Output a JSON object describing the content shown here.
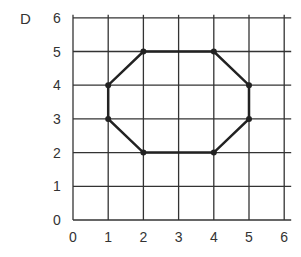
{
  "figure_label": "D",
  "grid": {
    "x_ticks": [
      "0",
      "1",
      "2",
      "3",
      "4",
      "5",
      "6"
    ],
    "y_ticks": [
      "0",
      "1",
      "2",
      "3",
      "4",
      "5",
      "6"
    ],
    "origin_px": [
      73,
      220
    ],
    "unit_px": [
      35.2,
      33.7
    ]
  },
  "shape": {
    "name": "octagon",
    "vertices": [
      [
        2,
        5
      ],
      [
        4,
        5
      ],
      [
        5,
        4
      ],
      [
        5,
        3
      ],
      [
        4,
        2
      ],
      [
        2,
        2
      ],
      [
        1,
        3
      ],
      [
        1,
        4
      ]
    ]
  },
  "colors": {
    "grid": "#333333",
    "shape": "#222222"
  }
}
